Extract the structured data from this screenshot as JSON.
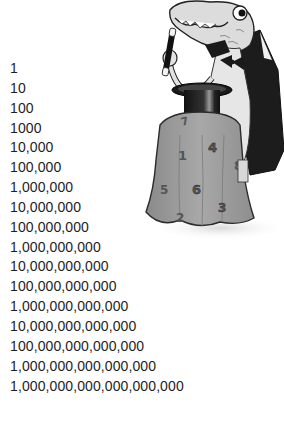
{
  "numbers": [
    "1",
    "10",
    "100",
    "1000",
    "10,000",
    "100,000",
    "1,000,000",
    "10,000,000",
    "100,000,000",
    "1,000,000,000",
    "10,000,000,000",
    "100,000,000,000",
    "1,000,000,000,000",
    "10,000,000,000,000",
    "100,000,000,000,000",
    "1,000,000,000,000,000",
    "1,000,000,000,000,000,000"
  ],
  "illustration": {
    "subject": "cartoon dinosaur magician in cape holding a wand over a top hat on a cloth-draped table",
    "table_cloth_digits": [
      "7",
      "1",
      "4",
      "8",
      "5",
      "6",
      "3",
      "2"
    ],
    "colors": {
      "cloth": "#9a9a9a",
      "cloth_outline": "#2a2a2a",
      "cape": "#1c1c1c",
      "skin": "#d8d8d8",
      "hat": "#222222"
    }
  }
}
